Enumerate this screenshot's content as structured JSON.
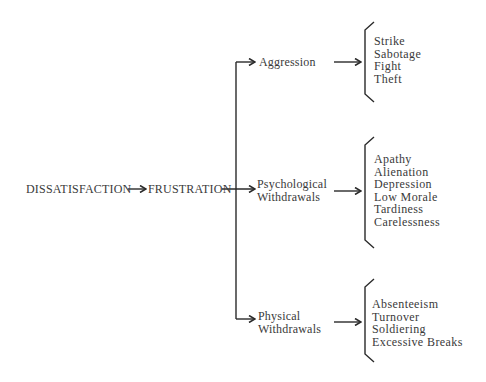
{
  "diagram": {
    "root": "DISSATISFACTION",
    "middle": "FRUSTRATION",
    "branches": [
      {
        "label_line1": "Aggression",
        "label_line2": "",
        "outcomes": [
          "Strike",
          "Sabotage",
          "Fight",
          "Theft"
        ]
      },
      {
        "label_line1": "Psychological",
        "label_line2": "Withdrawals",
        "outcomes": [
          "Apathy",
          "Alienation",
          "Depression",
          "Low Morale",
          "Tardiness",
          "Carelessness"
        ]
      },
      {
        "label_line1": "Physical",
        "label_line2": "Withdrawals",
        "outcomes": [
          "Absenteeism",
          "Turnover",
          "Soldiering",
          "Excessive Breaks"
        ]
      }
    ],
    "colors": {
      "ink": "#2a2a2a",
      "text": "#3a3a3a",
      "background": "#ffffff"
    }
  }
}
